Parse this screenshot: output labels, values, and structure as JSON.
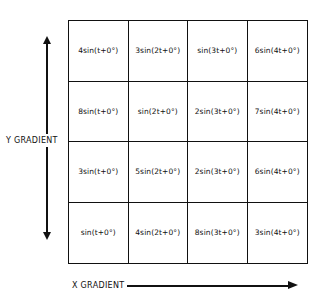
{
  "labels": {
    "y_axis": "Y GRADIENT",
    "x_axis": "X GRADIENT"
  },
  "grid": {
    "rows": [
      [
        "4sin(t+0°)",
        "3sin(2t+0°)",
        "sin(3t+0°)",
        "6sin(4t+0°)"
      ],
      [
        "8sin(t+0°)",
        "sin(2t+0°)",
        "2sin(3t+0°)",
        "7sin(4t+0°)"
      ],
      [
        "3sin(t+0°)",
        "5sin(2t+0°)",
        "2sin(3t+0°)",
        "6sin(4t+0°)"
      ],
      [
        "sin(t+0°)",
        "4sin(2t+0°)",
        "8sin(3t+0°)",
        "3sin(4t+0°)"
      ]
    ]
  }
}
